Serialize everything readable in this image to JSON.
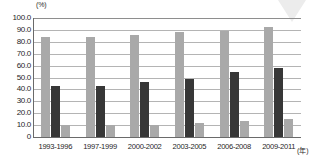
{
  "chart_data": {
    "type": "bar",
    "title": "",
    "subtitle": "",
    "xlabel": "(年)",
    "ylabel": "(%)",
    "ylim": [
      0,
      100
    ],
    "ytick_labels": [
      "100.0",
      "90.0",
      "80.0",
      "70.0",
      "60.0",
      "50.0",
      "40.0",
      "30.0",
      "20.0",
      "10.0",
      "0"
    ],
    "ytick_values": [
      100,
      90,
      80,
      70,
      60,
      50,
      40,
      30,
      20,
      10,
      0
    ],
    "ytick_step": 10,
    "grid": true,
    "legend": "none",
    "categories": [
      "1993-1996",
      "1997-1999",
      "2000-2002",
      "2003-2005",
      "2006-2008",
      "2009-2011"
    ],
    "series": [
      {
        "name": "series-1",
        "color": "#a9a9a9",
        "values": [
          84.0,
          84.0,
          86.0,
          88.0,
          89.5,
          92.5
        ]
      },
      {
        "name": "series-2",
        "color": "#373737",
        "values": [
          43.0,
          43.0,
          46.0,
          49.0,
          55.0,
          58.0
        ]
      },
      {
        "name": "series-3",
        "color": "#a9a9a9",
        "values": [
          10.5,
          10.5,
          10.0,
          11.5,
          13.5,
          15.5
        ]
      }
    ],
    "annotations": []
  },
  "decor": {
    "watermark_icon": "triangle-down-icon",
    "watermark_color": "#ececec"
  }
}
